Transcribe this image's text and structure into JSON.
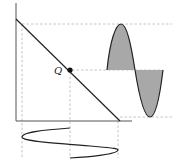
{
  "diagram": {
    "q_point_label": "Q",
    "colors": {
      "background": "#ffffff",
      "line": "#222222",
      "axis": "#555555",
      "dashed": "#b0b0b0",
      "fill": "#a8a8a8"
    },
    "elements": [
      {
        "name": "y-axis"
      },
      {
        "name": "x-axis"
      },
      {
        "name": "load-line"
      },
      {
        "name": "q-point"
      },
      {
        "name": "output-waveform"
      },
      {
        "name": "input-waveform"
      }
    ]
  }
}
